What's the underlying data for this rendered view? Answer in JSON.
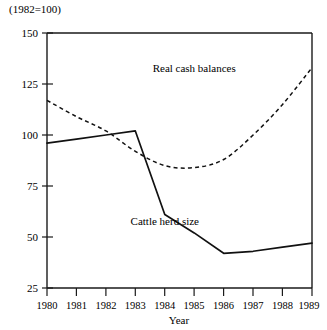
{
  "note": "(1982=100)",
  "chart_data": {
    "type": "line",
    "title": "",
    "xlabel": "Year",
    "ylabel": "",
    "x": [
      1980,
      1981,
      1982,
      1983,
      1984,
      1985,
      1986,
      1987,
      1988,
      1989
    ],
    "categories": [
      "1980",
      "1981",
      "1982",
      "1983",
      "1984",
      "1985",
      "1986",
      "1987",
      "1988",
      "1989"
    ],
    "xlim": [
      1980,
      1989
    ],
    "ylim": [
      25,
      150
    ],
    "yticks": [
      25,
      50,
      75,
      100,
      125,
      150
    ],
    "ytick_labels": [
      "25",
      "50",
      "75",
      "100",
      "125",
      "150"
    ],
    "grid": false,
    "legend_position": "inline-annotation",
    "series": [
      {
        "name": "Real cash balances",
        "style": "dashed",
        "values": [
          117,
          109,
          102,
          92,
          85,
          84,
          88,
          100,
          115,
          133
        ],
        "label_x": 1985,
        "label_y": 131
      },
      {
        "name": "Cattle herd size",
        "style": "solid",
        "values": [
          96,
          98,
          100,
          102,
          61,
          52,
          42,
          43,
          45,
          47
        ],
        "label_x": 1984,
        "label_y": 56
      }
    ],
    "annotations": [
      "(1982=100)"
    ]
  }
}
